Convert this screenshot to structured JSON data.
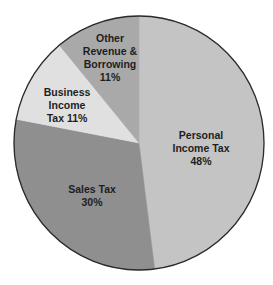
{
  "chart_data": {
    "type": "pie",
    "title": "",
    "start_angle_deg": 0,
    "direction": "clockwise",
    "categories": [
      "Personal Income Tax",
      "Sales Tax",
      "Business Income Tax",
      "Other Revenue & Borrowing"
    ],
    "values": [
      48,
      30,
      11,
      11
    ],
    "unit": "%",
    "colors": [
      "#c4c4c4",
      "#8f8f8f",
      "#e0e0e0",
      "#a9a9a9"
    ],
    "labels": [
      {
        "lines": [
          "Personal",
          "Income Tax",
          "48%"
        ]
      },
      {
        "lines": [
          "Sales Tax",
          "30%"
        ]
      },
      {
        "lines": [
          "Business",
          "Income",
          "Tax 11%"
        ]
      },
      {
        "lines": [
          "Other",
          "Revenue &",
          "Borrowing",
          "11%"
        ]
      }
    ],
    "legend": "none (labels inside slices)",
    "outline_color": "#2a2a2a"
  }
}
